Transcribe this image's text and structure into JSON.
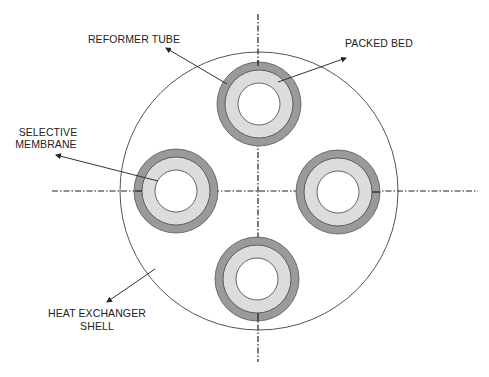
{
  "diagram": {
    "labels": {
      "reformer_tube": "REFORMER TUBE",
      "packed_bed": "PACKED BED",
      "selective_membrane_line1": "SELECTIVE",
      "selective_membrane_line2": "MEMBRANE",
      "heat_exchanger_line1": "HEAT EXCHANGER",
      "heat_exchanger_line2": "SHELL"
    },
    "shell": {
      "cx": 259,
      "cy": 191,
      "r": 139,
      "stroke": "#555555"
    },
    "tubes": [
      {
        "id": "top",
        "cx": 259,
        "cy": 104
      },
      {
        "id": "left",
        "cx": 176,
        "cy": 191
      },
      {
        "id": "right",
        "cx": 338,
        "cy": 192
      },
      {
        "id": "bottom",
        "cx": 257,
        "cy": 279
      }
    ],
    "tube_radii": {
      "outer": 42,
      "middle": 34,
      "inner": 21
    },
    "colors": {
      "reformer_tube_wall": "#9a9a9a",
      "packed_bed": "#dcdcdc",
      "membrane_core": "#ffffff",
      "outline": "#444444",
      "centerline": "#222222"
    }
  }
}
